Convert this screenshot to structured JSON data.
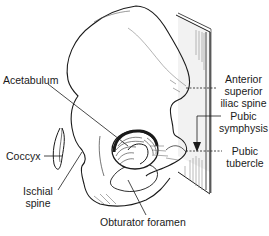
{
  "diagram": {
    "labels": {
      "acetabulum": "Acetabulum",
      "asis_line1": "Anterior",
      "asis_line2": "superior",
      "asis_line3": "iliac spine",
      "pubic_symphysis_line1": "Pubic",
      "pubic_symphysis_line2": "symphysis",
      "coccyx": "Coccyx",
      "ischial_spine_line1": "Ischial",
      "ischial_spine_line2": "spine",
      "pubic_tubercle_line1": "Pubic",
      "pubic_tubercle_line2": "tubercle",
      "obturator_foramen": "Obturator foramen"
    },
    "colors": {
      "ink": "#1a1a1a",
      "background": "#ffffff",
      "plane_shade": "#9a9a9a"
    }
  }
}
